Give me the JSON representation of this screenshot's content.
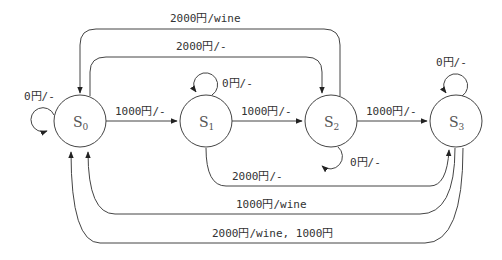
{
  "diagram": {
    "type": "state-machine",
    "states": [
      {
        "id": "S0",
        "base": "S",
        "sub": "0"
      },
      {
        "id": "S1",
        "base": "S",
        "sub": "1"
      },
      {
        "id": "S2",
        "base": "S",
        "sub": "2"
      },
      {
        "id": "S3",
        "base": "S",
        "sub": "3"
      }
    ],
    "transitions": [
      {
        "from": "S0",
        "to": "S0",
        "label": "0円/-"
      },
      {
        "from": "S0",
        "to": "S1",
        "label": "1000円/-"
      },
      {
        "from": "S1",
        "to": "S1",
        "label": "0円/-"
      },
      {
        "from": "S1",
        "to": "S2",
        "label": "1000円/-"
      },
      {
        "from": "S2",
        "to": "S2",
        "label": "0円/-"
      },
      {
        "from": "S2",
        "to": "S3",
        "label": "1000円/-"
      },
      {
        "from": "S3",
        "to": "S3",
        "label": "0円/-"
      },
      {
        "from": "S2",
        "to": "S0",
        "label": "2000円/wine"
      },
      {
        "from": "S0",
        "to": "S2",
        "label": "2000円/-"
      },
      {
        "from": "S1",
        "to": "S3",
        "label": "2000円/-"
      },
      {
        "from": "S3",
        "to": "S0",
        "label": "1000円/wine"
      },
      {
        "from": "S3",
        "to": "S0",
        "label": "2000円/wine, 1000円"
      }
    ]
  }
}
